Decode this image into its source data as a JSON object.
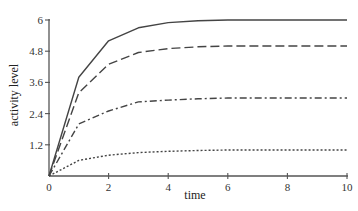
{
  "chart_data": {
    "type": "line",
    "title": "",
    "xlabel": "time",
    "ylabel": "activity level",
    "xlim": [
      0,
      10
    ],
    "ylim": [
      0,
      6
    ],
    "grid": false,
    "legend": null,
    "x_ticks": [
      0,
      2,
      4,
      6,
      8,
      10
    ],
    "y_ticks": [
      1.2,
      2.4,
      3.6,
      4.8,
      6
    ],
    "y_tick_labels": [
      "1.2",
      "2.4",
      "3.6",
      "4.8",
      "6"
    ],
    "x_tick_labels": [
      "0",
      "2",
      "4",
      "6",
      "8",
      "10"
    ],
    "x": [
      0,
      1,
      2,
      3,
      4,
      5,
      6,
      7,
      8,
      9,
      10
    ],
    "series": [
      {
        "name": "solid",
        "style": "solid",
        "values": [
          0,
          3.8,
          5.2,
          5.7,
          5.9,
          5.97,
          6.0,
          6.0,
          6.0,
          6.0,
          6.0
        ]
      },
      {
        "name": "dashed",
        "style": "dashed",
        "values": [
          0,
          3.2,
          4.3,
          4.75,
          4.9,
          4.97,
          5.0,
          5.0,
          5.0,
          5.0,
          5.0
        ]
      },
      {
        "name": "dash-dot",
        "style": "dashdot",
        "values": [
          0,
          2.0,
          2.5,
          2.85,
          2.92,
          2.97,
          3.0,
          3.0,
          3.0,
          3.0,
          3.0
        ]
      },
      {
        "name": "dotted",
        "style": "dotted",
        "values": [
          0,
          0.6,
          0.8,
          0.9,
          0.95,
          0.98,
          1.0,
          1.0,
          1.0,
          1.0,
          1.0
        ]
      }
    ]
  },
  "labels": {
    "xlabel": "time",
    "ylabel": "activity level"
  }
}
